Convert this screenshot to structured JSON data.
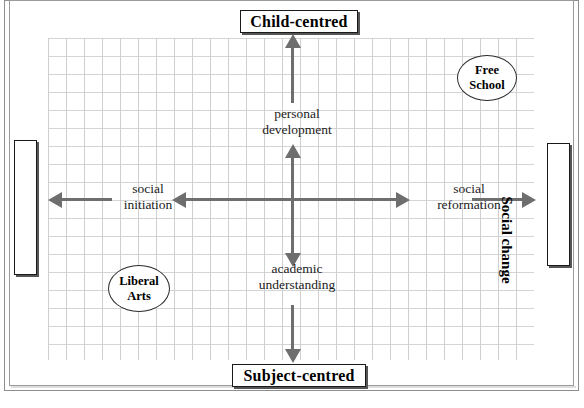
{
  "figure": {
    "top_caption": "",
    "poles": {
      "top": "Child-centred",
      "bottom": "Subject-centred",
      "left": "Social acceptance",
      "right": "Social change"
    },
    "quadrant_labels": {
      "upper_center": "personal\ndevelopment",
      "upper_center_line1": "personal",
      "upper_center_line2": "development",
      "lower_center_line1": "academic",
      "lower_center_line2": "understanding",
      "left_center_line1": "social",
      "left_center_line2": "initiation",
      "right_center_line1": "social",
      "right_center_line2": "reformation"
    },
    "nodes": [
      {
        "id": "free-school",
        "line1": "Free",
        "line2": "School"
      },
      {
        "id": "liberal-arts",
        "line1": "Liberal",
        "line2": "Arts"
      }
    ],
    "colors": {
      "axis": "#6e6e6e",
      "grid": "#d2d2d2",
      "frame": "#8e8e8e",
      "box_border": "#1a1a1a",
      "box_shadow": "#555555",
      "text": "#1b1b1b"
    }
  }
}
